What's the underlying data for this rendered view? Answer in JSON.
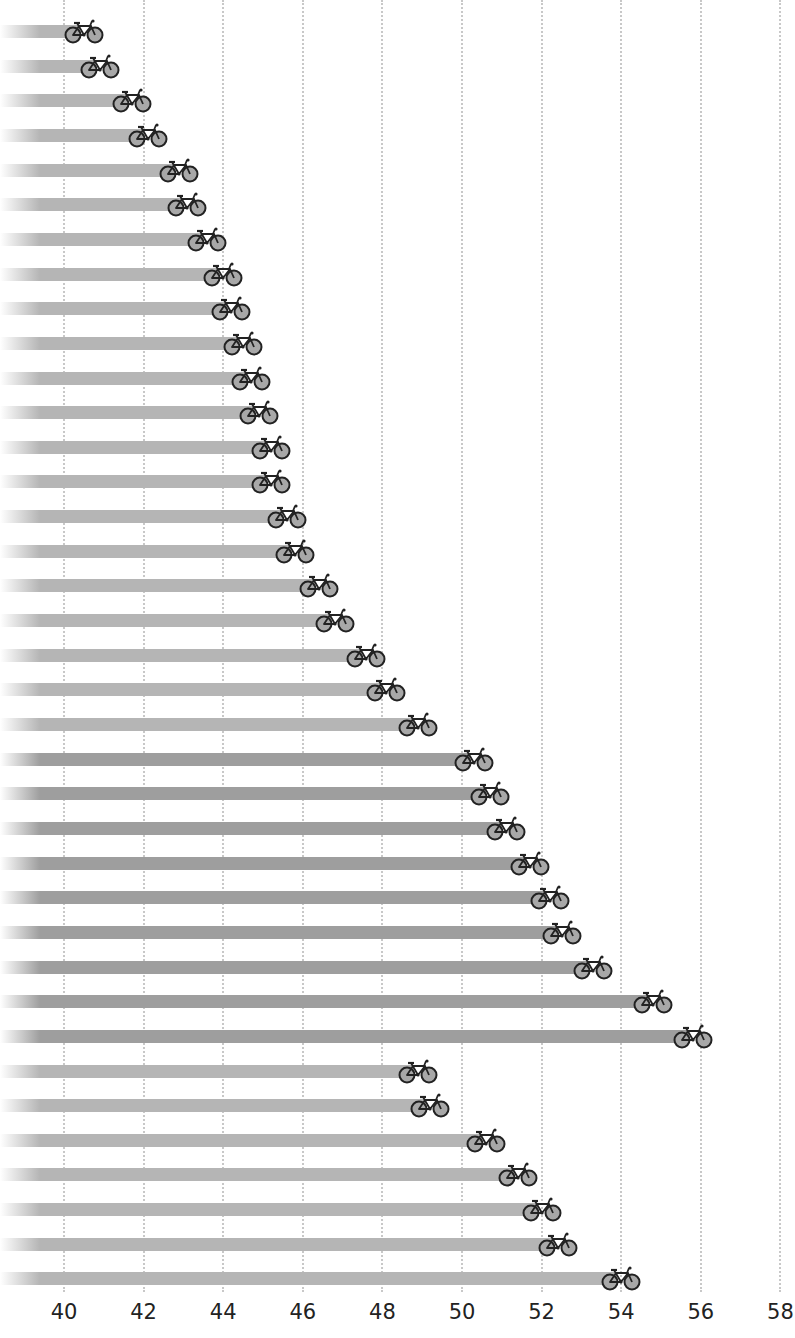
{
  "chart_data": {
    "type": "bar",
    "orientation": "horizontal",
    "title": "",
    "xlabel": "",
    "ylabel": "",
    "xlim": [
      40,
      58
    ],
    "x_ticks": [
      "40",
      "42",
      "44",
      "46",
      "48",
      "50",
      "52",
      "54",
      "56",
      "58"
    ],
    "grid": "vertical dotted",
    "marker": "bicycle-icon",
    "categories": [
      "1",
      "2",
      "3",
      "4",
      "5",
      "6",
      "7",
      "8",
      "9",
      "10",
      "11",
      "12",
      "13",
      "14",
      "15",
      "16",
      "17",
      "18",
      "19",
      "20",
      "21",
      "22",
      "23",
      "24",
      "25",
      "26",
      "27",
      "28",
      "29",
      "30",
      "31",
      "32",
      "33",
      "34",
      "35",
      "36",
      "37"
    ],
    "values": [
      40.5,
      40.9,
      41.7,
      42.1,
      42.9,
      43.1,
      43.6,
      44.0,
      44.2,
      44.5,
      44.7,
      44.9,
      45.2,
      45.2,
      45.6,
      45.8,
      46.4,
      46.8,
      47.6,
      48.1,
      48.9,
      50.3,
      50.7,
      51.1,
      51.7,
      52.2,
      52.5,
      53.3,
      54.8,
      55.8,
      48.9,
      49.2,
      50.6,
      51.4,
      52.0,
      52.4,
      54.0
    ],
    "shade": [
      "light",
      "light",
      "light",
      "light",
      "light",
      "light",
      "light",
      "light",
      "light",
      "light",
      "light",
      "light",
      "light",
      "light",
      "light",
      "light",
      "light",
      "light",
      "light",
      "light",
      "light",
      "dark",
      "dark",
      "dark",
      "dark",
      "dark",
      "dark",
      "dark",
      "dark",
      "dark",
      "light",
      "light",
      "light",
      "light",
      "light",
      "light",
      "light"
    ]
  },
  "colors": {
    "bar_light": "#b5b5b5",
    "bar_dark": "#9e9e9e",
    "bike_fill": "#a8a8a8",
    "bike_stroke": "#222222",
    "grid": "#c8c8c8"
  }
}
